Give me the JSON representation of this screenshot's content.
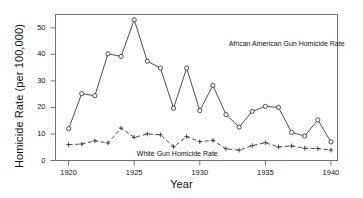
{
  "chart_data": {
    "type": "line",
    "title": "",
    "xlabel": "Year",
    "ylabel": "Homicide Rate (per 100,000)",
    "xlim": [
      1919,
      1940.5
    ],
    "ylim": [
      0,
      55
    ],
    "grid": false,
    "legend_position": "inline-annotations",
    "xticks": [
      1920,
      1925,
      1930,
      1935,
      1940
    ],
    "yticks": [
      0,
      10,
      20,
      30,
      40,
      50
    ],
    "x": [
      1920,
      1921,
      1922,
      1923,
      1924,
      1925,
      1926,
      1927,
      1928,
      1929,
      1930,
      1931,
      1932,
      1933,
      1934,
      1935,
      1936,
      1937,
      1938,
      1939,
      1940
    ],
    "series": [
      {
        "name": "African American Gun Homicide Rate",
        "marker": "circle",
        "linestyle": "solid",
        "color": "#3a3a3a",
        "values": [
          12.0,
          25.2,
          24.4,
          40.2,
          39.2,
          53.0,
          37.4,
          34.8,
          19.7,
          34.8,
          18.8,
          28.3,
          17.3,
          12.6,
          18.5,
          20.4,
          20.0,
          10.6,
          9.2,
          15.3,
          7.0
        ]
      },
      {
        "name": "White Gun Homicide Rate",
        "marker": "plus",
        "linestyle": "dashed",
        "color": "#3a3a3a",
        "values": [
          6.0,
          6.2,
          7.4,
          6.6,
          12.2,
          8.7,
          10.0,
          9.7,
          5.2,
          9.0,
          7.1,
          7.6,
          4.4,
          3.9,
          5.6,
          6.7,
          5.1,
          5.5,
          4.6,
          4.5,
          3.9
        ]
      }
    ],
    "annotations": [
      {
        "text": "African American Gun Homicide Rate",
        "x": 1932.2,
        "y": 43.5
      },
      {
        "text": "White Gun Homicide Rate",
        "x": 1925.2,
        "y": 2.0
      }
    ]
  },
  "axis": {
    "x_title": "Year",
    "y_title": "Homicide Rate (per 100,000)",
    "xtick_labels": [
      "1920",
      "1925",
      "1930",
      "1935",
      "1940"
    ],
    "ytick_labels": [
      "0",
      "10",
      "20",
      "30",
      "40",
      "50"
    ]
  },
  "annotations": {
    "black_series": "African American Gun Homicide Rate",
    "white_series": "White Gun Homicide Rate"
  },
  "colors": {
    "line": "#3a3a3a",
    "frame": "#6f6f8a",
    "text": "#111111",
    "background": "#ffffff"
  }
}
